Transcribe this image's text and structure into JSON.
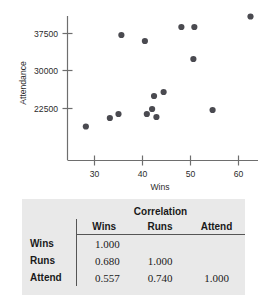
{
  "chart_data": [
    {
      "type": "scatter",
      "title": "",
      "xlabel": "Wins",
      "ylabel": "Attendance",
      "xlim": [
        26,
        65
      ],
      "ylim": [
        17500,
        41500
      ],
      "xticks": [
        30,
        40,
        50,
        60
      ],
      "yticks": [
        22500,
        30000,
        37500
      ],
      "xtick_labels": [
        "30",
        "40",
        "50",
        "60"
      ],
      "ytick_labels": [
        "22500",
        "30000",
        "37500"
      ],
      "grid": false,
      "legend": "none",
      "marker_color": "#4a4a50",
      "points": [
        {
          "x": 28.2,
          "y": 18900
        },
        {
          "x": 35.6,
          "y": 37200
        },
        {
          "x": 33.2,
          "y": 20600
        },
        {
          "x": 35.0,
          "y": 21400
        },
        {
          "x": 40.5,
          "y": 36000
        },
        {
          "x": 40.9,
          "y": 21400
        },
        {
          "x": 42.0,
          "y": 22400
        },
        {
          "x": 42.9,
          "y": 20800
        },
        {
          "x": 42.4,
          "y": 25000
        },
        {
          "x": 44.4,
          "y": 25800
        },
        {
          "x": 48.1,
          "y": 38800
        },
        {
          "x": 50.8,
          "y": 38800
        },
        {
          "x": 50.6,
          "y": 32400
        },
        {
          "x": 54.6,
          "y": 22200
        },
        {
          "x": 62.5,
          "y": 40900
        }
      ]
    },
    {
      "type": "table",
      "title": "Correlation",
      "columns": [
        "Wins",
        "Runs",
        "Attend"
      ],
      "row_labels": [
        "Wins",
        "Runs",
        "Attend"
      ],
      "rows": [
        [
          "1.000",
          "",
          ""
        ],
        [
          "0.680",
          "1.000",
          ""
        ],
        [
          "0.557",
          "0.740",
          "1.000"
        ]
      ]
    }
  ],
  "scatter": {
    "ylabel": "Attendance",
    "xlabel": "Wins",
    "yticks": [
      "37500",
      "30000",
      "22500"
    ],
    "xticks": [
      "30",
      "40",
      "50",
      "60"
    ]
  },
  "table": {
    "span_header": "Correlation",
    "col_headers": {
      "label": "",
      "wins": "Wins",
      "runs": "Runs",
      "attend": "Attend"
    },
    "rows": [
      {
        "label": "Wins",
        "wins": "1.000",
        "runs": "",
        "attend": ""
      },
      {
        "label": "Runs",
        "wins": "0.680",
        "runs": "1.000",
        "attend": ""
      },
      {
        "label": "Attend",
        "wins": "0.557",
        "runs": "0.740",
        "attend": "1.000"
      }
    ]
  }
}
